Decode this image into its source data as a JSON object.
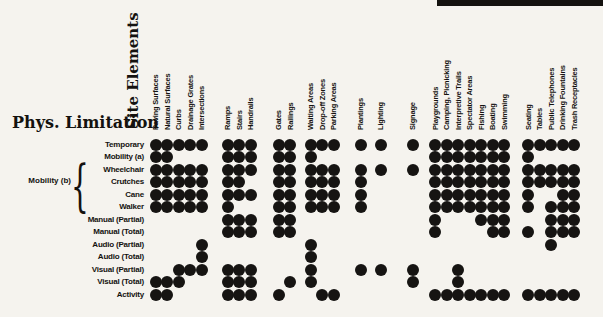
{
  "chart_data": {
    "type": "heatmap",
    "title_columns": "Site Elements",
    "title_rows": "Phys. Limitation",
    "dot_color": "#161412",
    "columns": [
      "Paving Surfaces",
      "Natural Surfaces",
      "Curbs",
      "Drainage Grates",
      "Intersections",
      "Ramps",
      "Stairs",
      "Handrails",
      "Gates",
      "Railings",
      "Waiting Areas",
      "Drop-off Zones",
      "Parking Areas",
      "Plantings",
      "Lighting",
      "Signage",
      "Playgrounds",
      "Camping, Picnicking",
      "Interpretive Trails",
      "Spectator Areas",
      "Fishing",
      "Boating",
      "Swimming",
      "Seating",
      "Tables",
      "Public Telephones",
      "Drinking Fountains",
      "Trash Receptacles"
    ],
    "column_groups": [
      0,
      0,
      0,
      0,
      0,
      1,
      1,
      1,
      2,
      2,
      3,
      3,
      3,
      4,
      5,
      6,
      7,
      7,
      7,
      7,
      7,
      7,
      7,
      8,
      8,
      8,
      8,
      8
    ],
    "rows": [
      "Temporary",
      "Mobility (a)",
      "Wheelchair",
      "Crutches",
      "Cane",
      "Walker",
      "Manual (Partial)",
      "Manual (Total)",
      "Audio (Partial)",
      "Audio (Total)",
      "Visual (Partial)",
      "Visual (Total)",
      "Activity"
    ],
    "row_group": {
      "label": "Mobility (b)",
      "members": [
        "Wheelchair",
        "Crutches",
        "Cane",
        "Walker"
      ]
    },
    "matrix": [
      [
        1,
        1,
        1,
        1,
        1,
        1,
        1,
        1,
        1,
        1,
        1,
        1,
        1,
        1,
        1,
        1,
        1,
        1,
        1,
        1,
        1,
        1,
        1,
        1,
        1,
        1,
        1,
        1
      ],
      [
        1,
        1,
        0,
        0,
        0,
        1,
        1,
        1,
        1,
        1,
        1,
        0,
        0,
        0,
        0,
        0,
        1,
        1,
        1,
        1,
        1,
        1,
        1,
        1,
        0,
        0,
        0,
        0
      ],
      [
        1,
        1,
        1,
        1,
        1,
        1,
        1,
        1,
        1,
        1,
        1,
        1,
        1,
        1,
        1,
        1,
        1,
        1,
        1,
        1,
        1,
        1,
        1,
        1,
        1,
        1,
        1,
        1
      ],
      [
        1,
        1,
        1,
        1,
        1,
        1,
        1,
        0,
        1,
        1,
        1,
        1,
        1,
        1,
        0,
        0,
        1,
        1,
        1,
        1,
        1,
        1,
        1,
        1,
        1,
        1,
        1,
        1
      ],
      [
        1,
        1,
        1,
        1,
        1,
        1,
        1,
        1,
        1,
        1,
        1,
        1,
        1,
        1,
        0,
        0,
        1,
        1,
        1,
        1,
        1,
        1,
        1,
        1,
        0,
        0,
        1,
        1
      ],
      [
        1,
        1,
        1,
        1,
        1,
        1,
        0,
        0,
        1,
        1,
        1,
        1,
        1,
        1,
        0,
        0,
        1,
        1,
        1,
        1,
        1,
        1,
        1,
        1,
        0,
        1,
        1,
        1
      ],
      [
        0,
        0,
        0,
        0,
        0,
        1,
        1,
        1,
        1,
        1,
        0,
        0,
        0,
        0,
        0,
        0,
        1,
        0,
        0,
        0,
        1,
        1,
        1,
        0,
        0,
        1,
        1,
        1
      ],
      [
        0,
        0,
        0,
        0,
        0,
        1,
        1,
        1,
        1,
        1,
        0,
        0,
        0,
        0,
        0,
        0,
        1,
        0,
        0,
        0,
        0,
        1,
        1,
        1,
        0,
        1,
        1,
        1
      ],
      [
        0,
        0,
        0,
        0,
        1,
        0,
        0,
        0,
        0,
        0,
        1,
        0,
        0,
        0,
        0,
        0,
        0,
        0,
        0,
        0,
        0,
        0,
        0,
        0,
        0,
        1,
        0,
        0
      ],
      [
        0,
        0,
        0,
        0,
        1,
        0,
        0,
        0,
        0,
        0,
        1,
        0,
        0,
        0,
        0,
        0,
        0,
        0,
        0,
        0,
        0,
        0,
        0,
        0,
        0,
        0,
        0,
        0
      ],
      [
        0,
        0,
        1,
        1,
        1,
        1,
        1,
        1,
        0,
        0,
        1,
        0,
        0,
        1,
        1,
        1,
        0,
        0,
        1,
        0,
        0,
        0,
        0,
        0,
        0,
        0,
        0,
        0
      ],
      [
        1,
        1,
        1,
        0,
        0,
        1,
        1,
        1,
        0,
        1,
        1,
        0,
        0,
        0,
        0,
        1,
        0,
        0,
        1,
        0,
        0,
        0,
        0,
        0,
        0,
        0,
        0,
        0
      ],
      [
        1,
        1,
        0,
        0,
        0,
        1,
        1,
        1,
        1,
        0,
        0,
        1,
        1,
        0,
        0,
        0,
        1,
        1,
        1,
        1,
        1,
        1,
        1,
        1,
        1,
        1,
        1,
        1
      ]
    ]
  }
}
